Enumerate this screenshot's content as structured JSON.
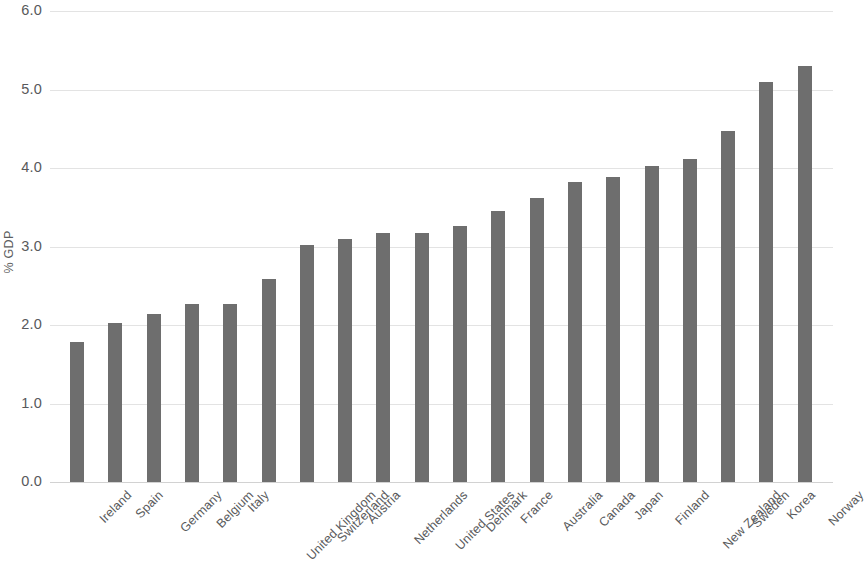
{
  "chart_data": {
    "type": "bar",
    "title": "",
    "xlabel": "",
    "ylabel": "% GDP",
    "ylim": [
      0.0,
      6.0
    ],
    "ytick_step": 1.0,
    "ytick_labels": [
      "6.0",
      "5.0",
      "4.0",
      "3.0",
      "2.0",
      "1.0",
      "0.0"
    ],
    "ytick_values": [
      6.0,
      5.0,
      4.0,
      3.0,
      2.0,
      1.0,
      0.0
    ],
    "grid": true,
    "legend": false,
    "bar_color": "#6e6e6e",
    "gridline_color": "#e3e3e3",
    "categories": [
      "Ireland",
      "Spain",
      "Germany",
      "Belgium",
      "Italy",
      "United Kingdom",
      "Switzerland",
      "Austria",
      "Netherlands",
      "United States",
      "Denmark",
      "France",
      "Australia",
      "Canada",
      "Japan",
      "Finland",
      "New Zealand",
      "Sweden",
      "Korea",
      "Norway"
    ],
    "values": [
      1.79,
      2.03,
      2.14,
      2.27,
      2.27,
      2.58,
      3.02,
      3.1,
      3.17,
      3.17,
      3.26,
      3.45,
      3.62,
      3.82,
      3.89,
      4.03,
      4.12,
      4.47,
      5.1,
      5.3
    ]
  }
}
